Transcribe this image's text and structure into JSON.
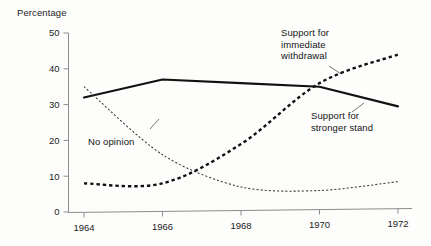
{
  "chart_data": {
    "type": "line",
    "title": "",
    "subtitle": "",
    "xlabel": "",
    "ylabel": "Percentage",
    "x": [
      1964,
      1966,
      1968,
      1970,
      1972
    ],
    "xtick_labels": [
      "1964",
      "1966",
      "1968",
      "1970",
      "1972"
    ],
    "ytick_labels": [
      "0",
      "10",
      "20",
      "30",
      "40",
      "50"
    ],
    "ytick_values": [
      0,
      10,
      20,
      30,
      40,
      50
    ],
    "xlim": [
      1964,
      1972
    ],
    "ylim": [
      0,
      50
    ],
    "grid": false,
    "legend_position": "inline-annotations",
    "series": [
      {
        "name": "Support for stronger stand",
        "style": "solid",
        "values": [
          32,
          37,
          36,
          35,
          29.5
        ]
      },
      {
        "name": "Support for immediate withdrawal",
        "style": "thick-dashed",
        "values": [
          8,
          8,
          19,
          36,
          44
        ]
      },
      {
        "name": "No opinion",
        "style": "thin-dotted",
        "values": [
          35,
          16,
          7,
          6,
          8.5
        ]
      }
    ],
    "annotations": [
      {
        "id": "immediate-withdrawal",
        "text": "Support for\nimmediate\nwithdrawal",
        "refers_to": "Support for immediate withdrawal"
      },
      {
        "id": "stronger-stand",
        "text": "Support for\nstronger stand",
        "refers_to": "Support for stronger stand"
      },
      {
        "id": "no-opinion",
        "text": "No opinion",
        "refers_to": "No opinion"
      }
    ]
  },
  "axis": {
    "y_title": "Percentage"
  },
  "colors": {
    "ink": "#111111",
    "axis": "#8d8d8d",
    "background": "#fdfdfc"
  }
}
